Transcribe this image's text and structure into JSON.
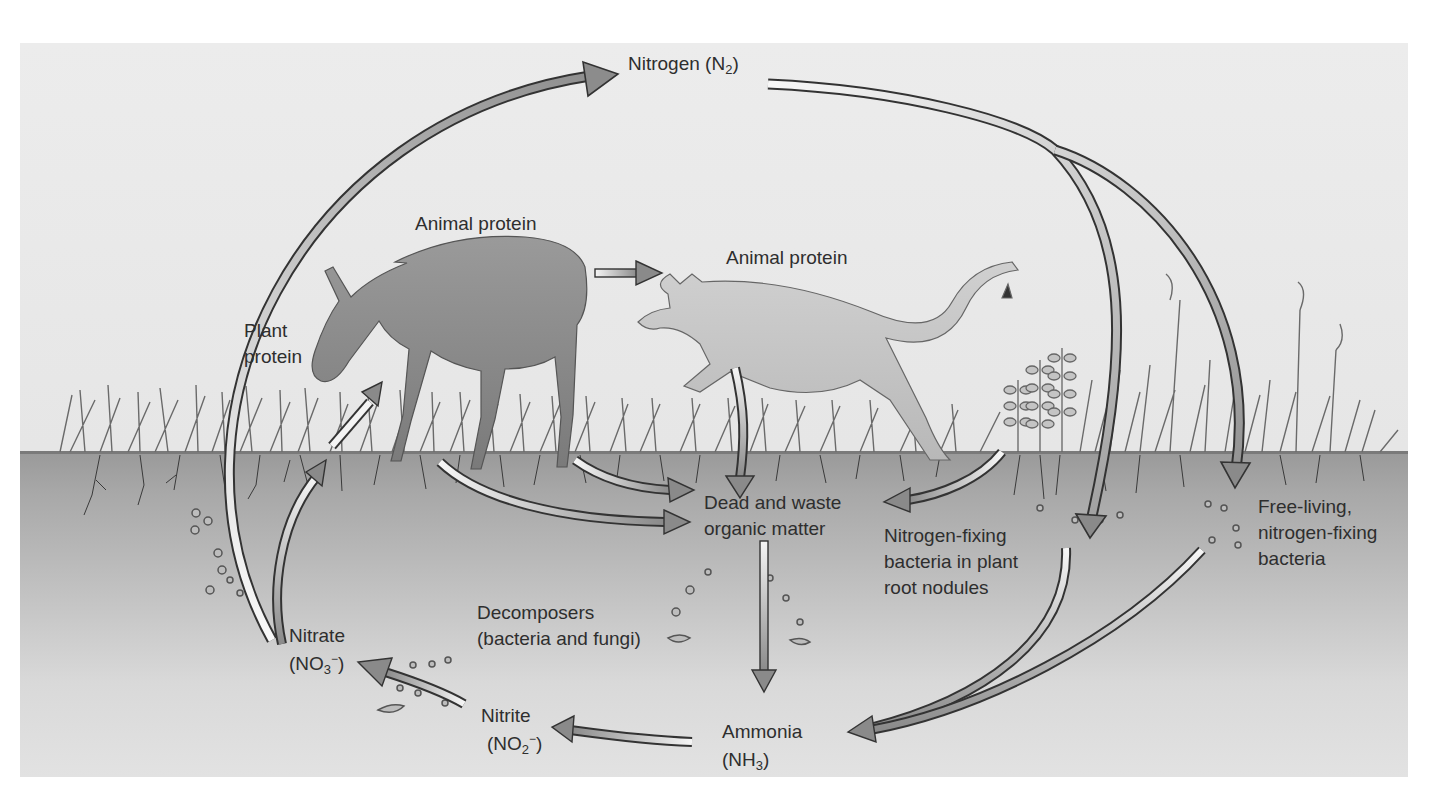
{
  "diagram": {
    "colors": {
      "panel_bg": "#e8e8e8",
      "soil_top": "#9a9a9a",
      "soil_bottom": "#e2e2e2",
      "arrow_dark": "#8a8a8a",
      "arrow_light": "#f4f4f4",
      "arrow_outline": "#333333",
      "text": "#2e2e2e"
    },
    "labels": {
      "nitrogen": {
        "text": "Nitrogen (N",
        "sub": "2",
        "tail": ")"
      },
      "animal_protein_deer": "Animal protein",
      "animal_protein_cougar": "Animal protein",
      "plant_protein": [
        "Plant",
        "protein"
      ],
      "dead_waste": [
        "Dead and waste",
        "organic matter"
      ],
      "nodule_bacteria": [
        "Nitrogen-fixing",
        "bacteria in plant",
        "root nodules"
      ],
      "free_living_bacteria": [
        "Free-living,",
        "nitrogen-fixing",
        "bacteria"
      ],
      "decomposers": [
        "Decomposers",
        "(bacteria and fungi)"
      ],
      "nitrate": {
        "line1": "Nitrate",
        "formula_pre": "(NO",
        "sub": "3",
        "sup": "−",
        "formula_post": ")"
      },
      "nitrite": {
        "line1": "Nitrite",
        "formula_pre": "(NO",
        "sub": "2",
        "sup": "−",
        "formula_post": ")"
      },
      "ammonia": {
        "line1": "Ammonia",
        "formula_pre": "(NH",
        "sub": "3",
        "formula_post": ")"
      }
    },
    "organisms": [
      "deer",
      "cougar",
      "grass",
      "legume plants",
      "tall grasses"
    ],
    "flows": [
      {
        "from": "Nitrate",
        "to": "Nitrogen (N2)",
        "name": "denitrification-arrow"
      },
      {
        "from": "Nitrogen (N2)",
        "to": "Nitrogen-fixing bacteria in plant root nodules",
        "name": "fixation-nodule-arrow"
      },
      {
        "from": "Nitrogen (N2)",
        "to": "Free-living, nitrogen-fixing bacteria",
        "name": "fixation-free-arrow"
      },
      {
        "from": "Animal protein (deer)",
        "to": "Animal protein (cougar)",
        "name": "predation-arrow"
      },
      {
        "from": "Nitrate",
        "to": "Plant protein",
        "name": "uptake-arrow"
      },
      {
        "from": "Plant protein",
        "to": "Animal protein (deer)",
        "name": "grazing-arrow"
      },
      {
        "from": "Animal protein (cougar)",
        "to": "Dead and waste organic matter",
        "name": "cougar-waste-arrow"
      },
      {
        "from": "Deer",
        "to": "Dead and waste organic matter",
        "name": "deer-waste-arrow"
      },
      {
        "from": "Plants",
        "to": "Dead and waste organic matter",
        "name": "plant-waste-arrow"
      },
      {
        "from": "Legume plants",
        "to": "Dead and waste organic matter",
        "name": "legume-waste-arrow"
      },
      {
        "from": "Dead and waste organic matter",
        "to": "Ammonia (NH3)",
        "name": "decomposition-arrow"
      },
      {
        "from": "Nitrogen-fixing bacteria in plant root nodules",
        "to": "Ammonia (NH3)",
        "name": "nodule-ammonia-arrow"
      },
      {
        "from": "Free-living, nitrogen-fixing bacteria",
        "to": "Ammonia (NH3)",
        "name": "free-ammonia-arrow"
      },
      {
        "from": "Ammonia (NH3)",
        "to": "Nitrite (NO2-)",
        "name": "nitrification-1-arrow"
      },
      {
        "from": "Nitrite (NO2-)",
        "to": "Nitrate (NO3-)",
        "name": "nitrification-2-arrow"
      }
    ]
  }
}
